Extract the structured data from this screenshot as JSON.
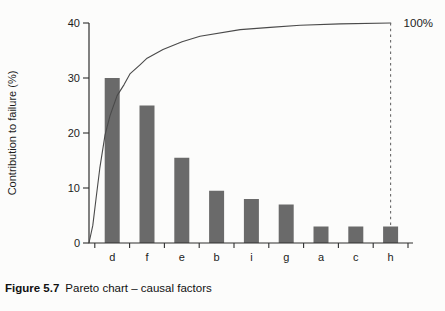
{
  "figure_caption": {
    "label": "Figure 5.7",
    "text": "Pareto chart – causal factors"
  },
  "chart_data": {
    "type": "bar",
    "subtype": "pareto",
    "title": "",
    "xlabel": "",
    "ylabel": "Contribution to failure (%)",
    "categories": [
      "d",
      "f",
      "e",
      "b",
      "i",
      "g",
      "a",
      "c",
      "h"
    ],
    "values": [
      30,
      25,
      15.5,
      9.5,
      8,
      7,
      3,
      3,
      3
    ],
    "ylim": [
      0,
      40
    ],
    "yticks": [
      0,
      10,
      20,
      30,
      40
    ],
    "grid": false,
    "legend": "none",
    "overlay": {
      "kind": "cumulative-percentage-curve",
      "end_label": "100%",
      "ends_at_category": "h",
      "dashed_drop_line_at_category": "h",
      "points_xfrac_pct": [
        [
          0.0,
          0
        ],
        [
          0.012,
          8
        ],
        [
          0.022,
          20
        ],
        [
          0.034,
          34
        ],
        [
          0.05,
          49
        ],
        [
          0.066,
          58
        ],
        [
          0.088,
          67
        ],
        [
          0.11,
          72
        ],
        [
          0.129,
          77
        ],
        [
          0.16,
          81
        ],
        [
          0.182,
          84
        ],
        [
          0.232,
          88
        ],
        [
          0.292,
          91.5
        ],
        [
          0.348,
          94
        ],
        [
          0.474,
          97
        ],
        [
          0.568,
          98
        ],
        [
          0.662,
          99
        ],
        [
          0.787,
          99.6
        ],
        [
          0.946,
          100
        ]
      ]
    },
    "colors": {
      "bar": "#6a6a6a",
      "curve": "#4a4a4a",
      "axis": "#2e2e2e",
      "dashed": "#6a6a6a",
      "text": "#1c1c1c"
    }
  }
}
